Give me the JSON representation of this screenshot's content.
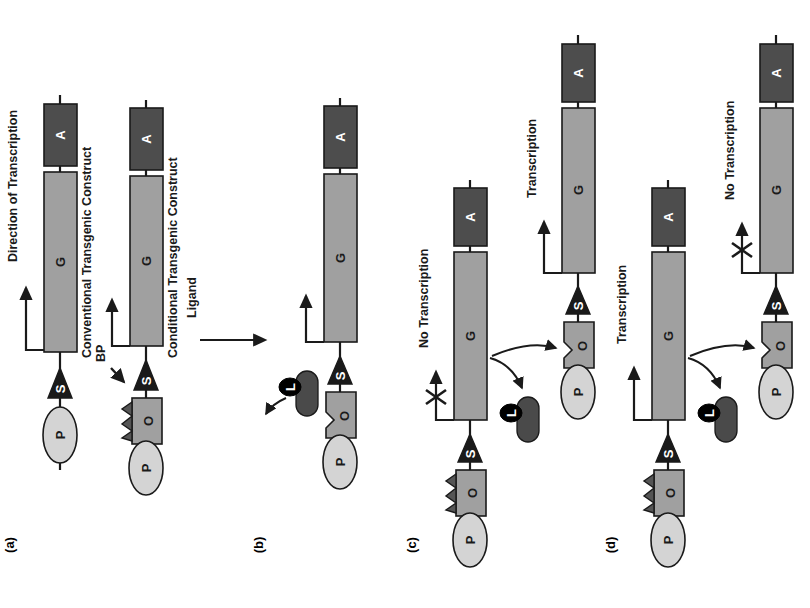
{
  "figure": {
    "orientation": "rotated-90-ccw",
    "background": "#ffffff"
  },
  "colors": {
    "promoter_fill": "#d4d4d4",
    "gene_fill": "#a0a0a0",
    "polyA_fill": "#4d4d4d",
    "operator_fill": "#a0a0a0",
    "bp_zigzag_fill": "#555555",
    "binding_protein_fill": "#4a4a4a",
    "ligand_fill": "#000000",
    "splice_fill": "#1a1a1a",
    "outline": "#1a1a1a"
  },
  "legend_elements": {
    "promoter": "P",
    "operator": "O",
    "splice_site": "S",
    "gene": "G",
    "polyA": "A",
    "ligand": "L",
    "binding_protein": "BP"
  },
  "panels": [
    {
      "id": "a",
      "label": "(a)",
      "annotations": [
        {
          "name": "direction-of-transcription",
          "text": "Direction of Transcription"
        },
        {
          "name": "conventional-construct-caption",
          "text": "Conventional Transgenic Construct"
        },
        {
          "name": "conditional-construct-caption",
          "text": "Conditional Transgenic Construct"
        },
        {
          "name": "bp-pointer-label",
          "text": "BP"
        }
      ],
      "constructs": [
        {
          "name": "conventional-transgenic-construct",
          "caption": "Conventional Transgenic Construct",
          "elements": [
            "P",
            "S",
            "G",
            "A"
          ],
          "transcription_status": "Direction of Transcription",
          "bp_bound": false
        },
        {
          "name": "conditional-transgenic-construct",
          "caption": "Conditional Transgenic Construct",
          "elements": [
            "P",
            "O",
            "S",
            "G",
            "A"
          ],
          "transcription_status": "",
          "bp_bound": true
        }
      ]
    },
    {
      "id": "b",
      "label": "(b)",
      "annotations": [
        {
          "name": "ligand-label",
          "text": "Ligand"
        }
      ],
      "constructs": [
        {
          "name": "ligand-released-construct",
          "caption": "",
          "elements": [
            "P",
            "O",
            "S",
            "G",
            "A"
          ],
          "transcription_status": "",
          "bp_bound": false,
          "bp_complex": {
            "binding_protein": "BP",
            "ligand": "L",
            "state": "released"
          }
        }
      ]
    },
    {
      "id": "c",
      "label": "(c)",
      "annotations": [],
      "constructs": [
        {
          "name": "bp-bound-no-transcription",
          "caption": "",
          "elements": [
            "P",
            "O",
            "S",
            "G",
            "A"
          ],
          "transcription_status": "No Transcription",
          "blocked": true,
          "bp_bound": true
        },
        {
          "name": "bp-released-transcription",
          "caption": "",
          "elements": [
            "P",
            "O",
            "S",
            "G",
            "A"
          ],
          "transcription_status": "Transcription",
          "blocked": false,
          "bp_bound": false
        }
      ],
      "bp_complex": {
        "binding_protein": "BP",
        "ligand": "L"
      }
    },
    {
      "id": "d",
      "label": "(d)",
      "annotations": [],
      "constructs": [
        {
          "name": "bp-bound-transcription",
          "caption": "",
          "elements": [
            "P",
            "O",
            "S",
            "G",
            "A"
          ],
          "transcription_status": "Transcription",
          "blocked": false,
          "bp_bound": true
        },
        {
          "name": "bp-released-no-transcription",
          "caption": "",
          "elements": [
            "P",
            "O",
            "S",
            "G",
            "A"
          ],
          "transcription_status": "No Transcription",
          "blocked": true,
          "bp_bound": false
        }
      ],
      "bp_complex": {
        "binding_protein": "BP",
        "ligand": "L"
      }
    }
  ],
  "labels": {
    "panel_a": "(a)",
    "panel_b": "(b)",
    "panel_c": "(c)",
    "panel_d": "(d)",
    "direction_of_transcription": "Direction of Transcription",
    "conventional_caption": "Conventional Transgenic Construct",
    "conditional_caption": "Conditional Transgenic Construct",
    "bp": "BP",
    "ligand": "Ligand",
    "no_transcription": "No Transcription",
    "transcription": "Transcription",
    "P": "P",
    "O": "O",
    "S": "S",
    "G": "G",
    "A": "A",
    "L": "L"
  }
}
